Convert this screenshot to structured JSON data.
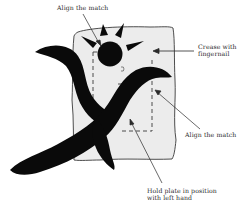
{
  "figure": {
    "colors": {
      "ink": "#0a0a0a",
      "paper": "#ececec",
      "outline": "#3a3a3a",
      "text": "#2a2a2a"
    }
  },
  "labels": {
    "align_top": "Align the match",
    "crease_line1": "Crease with",
    "crease_line2": "fingernail",
    "align_right": "Align the match",
    "hold_line1": "Hold plate in position",
    "hold_line2": "with left hand"
  }
}
